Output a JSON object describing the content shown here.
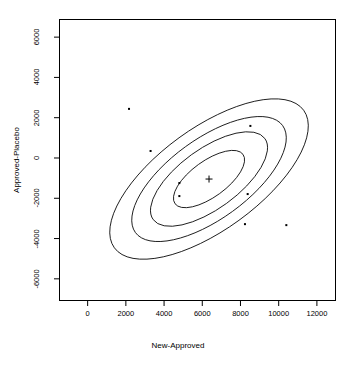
{
  "chart_data": {
    "type": "scatter",
    "title": "",
    "xlabel": "New-Approved",
    "ylabel": "Approved-Placebo",
    "xlim": [
      -1500,
      13000
    ],
    "ylim": [
      -7100,
      6900
    ],
    "xticks": [
      0,
      2000,
      4000,
      6000,
      8000,
      10000,
      12000
    ],
    "yticks": [
      6000,
      4000,
      2000,
      0,
      -2000,
      -4000,
      -6000
    ],
    "xtick_labels": [
      "0",
      "2000",
      "4000",
      "6000",
      "8000",
      "10000",
      "12000"
    ],
    "ytick_labels": [
      "6000",
      "4000",
      "2000",
      "0",
      "-2000",
      "-4000",
      "-6000"
    ],
    "grid": false,
    "legend": "none",
    "points": [
      {
        "x": 2165,
        "y": 2438
      },
      {
        "x": 3294,
        "y": 348
      },
      {
        "x": 4800,
        "y": -1244
      },
      {
        "x": 4800,
        "y": -1891
      },
      {
        "x": 8518,
        "y": 1592
      },
      {
        "x": 8376,
        "y": -1791
      },
      {
        "x": 8235,
        "y": -3284
      },
      {
        "x": 10400,
        "y": -3333
      }
    ],
    "center": {
      "x": 6353,
      "y": -1045,
      "marker": "+"
    },
    "ellipses": [
      {
        "level": 1,
        "rx": 42,
        "ry": 18,
        "angle": -36
      },
      {
        "level": 2,
        "rx": 69,
        "ry": 30,
        "angle": -36
      },
      {
        "level": 3,
        "rx": 91,
        "ry": 40,
        "angle": -36
      },
      {
        "level": 4,
        "rx": 117,
        "ry": 51,
        "angle": -36
      }
    ]
  },
  "axes": {
    "x_title": "New-Approved",
    "y_title": "Approved-Placebo"
  }
}
